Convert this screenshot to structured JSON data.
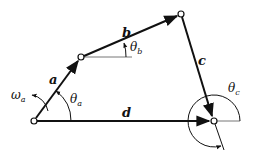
{
  "diagram": {
    "points": {
      "A": [
        34,
        121
      ],
      "B": [
        81,
        57
      ],
      "C": [
        181,
        14
      ],
      "D": [
        214,
        121
      ]
    },
    "links": [
      {
        "id": "a",
        "label": "a",
        "from": "A",
        "to": "B"
      },
      {
        "id": "b",
        "label": "b",
        "from": "B",
        "to": "C"
      },
      {
        "id": "c",
        "label": "c",
        "from": "C",
        "to": "D"
      },
      {
        "id": "d",
        "label": "d",
        "from": "A",
        "to": "D"
      }
    ],
    "labels": {
      "a": "a",
      "b": "b",
      "c": "c",
      "d": "d",
      "omega_a": "ω",
      "omega_a_sub": "a",
      "theta_a": "θ",
      "theta_a_sub": "a",
      "theta_b": "θ",
      "theta_b_sub": "b",
      "theta_c": "θ",
      "theta_c_sub": "c"
    },
    "colors": {
      "stroke": "#111111",
      "reference_line": "#777777",
      "background": "#ffffff"
    }
  }
}
